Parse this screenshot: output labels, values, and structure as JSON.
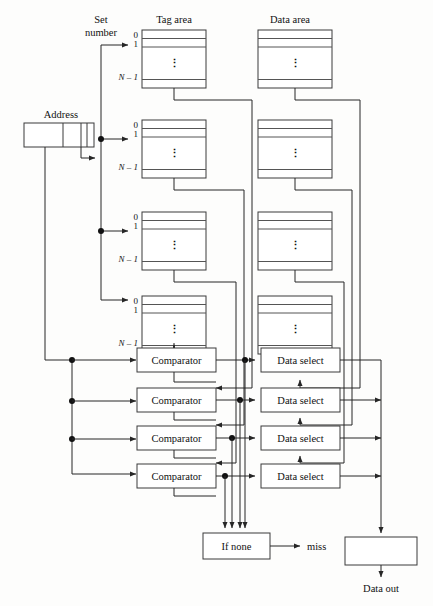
{
  "figure": {
    "background": "#fdfdfc",
    "line_color": "#262626"
  },
  "labels": {
    "set_number_line1": "Set",
    "set_number_line2": "number",
    "tag_area": "Tag area",
    "data_area": "Data area",
    "address": "Address",
    "miss": "miss",
    "data_out": "Data out",
    "if_none": "If none",
    "comparator": "Comparator",
    "data_select": "Data select",
    "index_first": "0",
    "index_second": "1",
    "index_last": "N – 1",
    "vertical_ellipsis": "⋮"
  },
  "ways": [
    {
      "index": 0,
      "tag_label": "Tag area",
      "comparator": "Comparator",
      "data_select": "Data select"
    },
    {
      "index": 1,
      "tag_label": "Tag area",
      "comparator": "Comparator",
      "data_select": "Data select"
    },
    {
      "index": 2,
      "tag_label": "Tag area",
      "comparator": "Comparator",
      "data_select": "Data select"
    },
    {
      "index": 3,
      "tag_label": "Tag area",
      "comparator": "Comparator",
      "data_select": "Data select"
    }
  ],
  "address_fields": [
    {
      "name": "tag-field"
    },
    {
      "name": "set-index-field"
    },
    {
      "name": "block-offset-field"
    }
  ],
  "colors": {
    "stroke": "#262626",
    "box_stroke": "#3a3a3a",
    "row_stroke": "#555555",
    "text": "#111111",
    "fill": "#ffffff"
  }
}
